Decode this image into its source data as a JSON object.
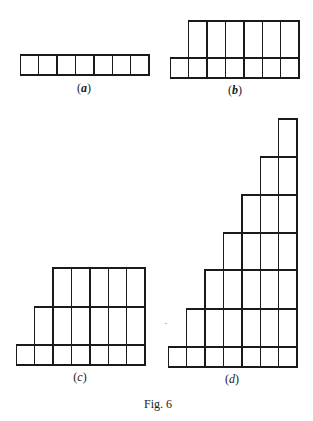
{
  "figure": {
    "caption": "Fig. 6",
    "caption_pos": [
      158,
      404
    ],
    "line_color": "#1a1a1a",
    "background": "#ffffff",
    "cell_width": 18.4,
    "panels": [
      {
        "id": "a",
        "label_open": "(",
        "label_letter": "a",
        "label_close": ")",
        "label_pos": [
          84,
          88
        ],
        "right_edge": 149,
        "rows": [
          {
            "top": 55,
            "height": 20,
            "cells": 7
          }
        ]
      },
      {
        "id": "b",
        "label_open": "(",
        "label_letter": "b",
        "label_close": ")",
        "label_pos": [
          235,
          90
        ],
        "right_edge": 299,
        "rows": [
          {
            "top": 21,
            "height": 37,
            "cells": 6
          },
          {
            "top": 58,
            "height": 20,
            "cells": 7
          }
        ]
      },
      {
        "id": "c",
        "label_open": "(",
        "label_letter": "c",
        "label_close": ")",
        "label_pos": [
          80,
          377
        ],
        "right_edge": 145,
        "rows": [
          {
            "top": 268,
            "height": 39,
            "cells": 5
          },
          {
            "top": 307,
            "height": 38,
            "cells": 6
          },
          {
            "top": 345,
            "height": 20,
            "cells": 7
          }
        ]
      },
      {
        "id": "d",
        "label_open": "(",
        "label_letter": "d",
        "label_close": ")",
        "label_pos": [
          232,
          379
        ],
        "right_edge": 297,
        "rows": [
          {
            "top": 119,
            "height": 38,
            "cells": 1
          },
          {
            "top": 157,
            "height": 38,
            "cells": 2
          },
          {
            "top": 195,
            "height": 38,
            "cells": 3
          },
          {
            "top": 233,
            "height": 37,
            "cells": 4
          },
          {
            "top": 270,
            "height": 39,
            "cells": 5
          },
          {
            "top": 309,
            "height": 38,
            "cells": 6
          },
          {
            "top": 347,
            "height": 20,
            "cells": 7
          }
        ]
      }
    ]
  }
}
